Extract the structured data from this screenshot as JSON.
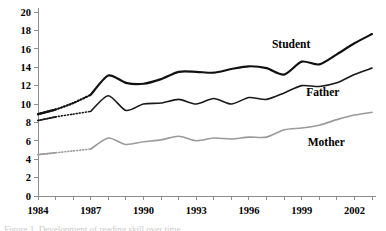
{
  "chart_data": {
    "type": "line",
    "title": "",
    "xlabel": "",
    "ylabel": "",
    "xlim": [
      1984,
      2003
    ],
    "ylim": [
      0,
      20
    ],
    "ytick_step": 2,
    "grid": false,
    "legend": "inline-labels",
    "x": [
      1984,
      1985,
      1986,
      1987,
      1988,
      1989,
      1990,
      1991,
      1992,
      1993,
      1994,
      1995,
      1996,
      1997,
      1998,
      1999,
      2000,
      2001,
      2002,
      2003
    ],
    "xticks_major": [
      1984,
      1987,
      1990,
      1993,
      1996,
      1999,
      2002
    ],
    "xtick_labels": [
      "1984",
      "1987",
      "1990",
      "1993",
      "1996",
      "1999",
      "2002"
    ],
    "yticks": [
      0,
      2,
      4,
      6,
      8,
      10,
      12,
      14,
      16,
      18,
      20
    ],
    "ytick_labels": [
      "0",
      "2",
      "4",
      "6",
      "8",
      "10",
      "12",
      "14",
      "16",
      "18",
      "20"
    ],
    "series": [
      {
        "name": "Student",
        "label": "Student",
        "color": "#111111",
        "width": 2.2,
        "dashed_range": [
          1984,
          1987
        ],
        "values": [
          8.9,
          9.4,
          10.1,
          11.0,
          13.1,
          12.3,
          12.2,
          12.7,
          13.5,
          13.5,
          13.4,
          13.8,
          14.1,
          13.9,
          13.2,
          14.6,
          14.3,
          15.4,
          16.6,
          17.6
        ]
      },
      {
        "name": "Father",
        "label": "Father",
        "color": "#1a1a1a",
        "width": 1.6,
        "dashed_range": [
          1984,
          1987
        ],
        "values": [
          8.2,
          8.6,
          8.9,
          9.2,
          10.9,
          9.3,
          10.0,
          10.1,
          10.5,
          10.0,
          10.6,
          10.0,
          10.7,
          10.5,
          11.2,
          12.0,
          11.9,
          12.3,
          13.2,
          13.9
        ]
      },
      {
        "name": "Mother",
        "label": "Mother",
        "color": "#9a9a9a",
        "width": 1.6,
        "dashed_range": [
          1984,
          1987
        ],
        "values": [
          4.5,
          4.7,
          4.9,
          5.1,
          6.3,
          5.6,
          5.9,
          6.1,
          6.5,
          6.0,
          6.3,
          6.2,
          6.4,
          6.4,
          7.2,
          7.4,
          7.7,
          8.3,
          8.8,
          9.1
        ]
      }
    ],
    "annotations": [
      {
        "text": "Student",
        "x": 1998.4,
        "y": 16.1
      },
      {
        "text": "Father",
        "x": 2000.2,
        "y": 10.9
      },
      {
        "text": "Mother",
        "x": 2000.4,
        "y": 5.4
      }
    ]
  },
  "caption": {
    "text": "Figure 1. Development of reading skill over time"
  }
}
